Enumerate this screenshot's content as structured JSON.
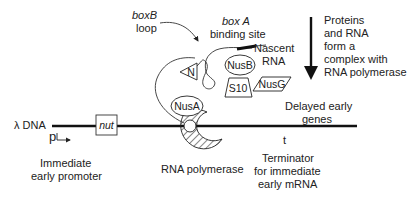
{
  "diagram": {
    "labels": {
      "boxb_line1": "boxB",
      "boxb_line2": "loop",
      "boxa_line1": "box A",
      "boxa_line2": "binding site",
      "nascent_line1": "Nascent",
      "nascent_line2": "RNA",
      "proteins_line1": "Proteins",
      "proteins_line2": "and RNA",
      "proteins_line3": "form a",
      "proteins_line4": "complex with",
      "proteins_line5": "RNA polymerase",
      "delayed_line1": "Delayed early",
      "delayed_line2": "genes",
      "lambda_dna": "λ DNA",
      "promoter_symbol": "p",
      "promoter_line1": "Immediate",
      "promoter_line2": "early promoter",
      "rna_polymerase": "RNA polymerase",
      "terminator_symbol": "t",
      "terminator_line1": "Terminator",
      "terminator_line2": "for immediate",
      "terminator_line3": "early mRNA"
    },
    "proteins": {
      "n": "N",
      "nusb": "NusB",
      "nusg": "NusG",
      "s10": "S10",
      "nusa": "NusA"
    },
    "dna_site": "nut"
  }
}
